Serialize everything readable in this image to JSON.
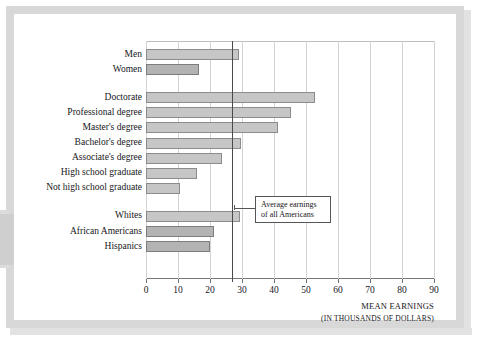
{
  "chart_data": {
    "type": "bar",
    "orientation": "horizontal",
    "title": "",
    "xlabel": "MEAN EARNINGS",
    "xlabel_sub": "(IN THOUSANDS OF DOLLARS)",
    "ylabel": "",
    "xlim": [
      0,
      90
    ],
    "xticks": [
      0,
      10,
      20,
      30,
      40,
      50,
      60,
      70,
      80,
      90
    ],
    "xtick_labels": [
      "0",
      "10",
      "20",
      "30",
      "40",
      "50",
      "60",
      "70",
      "80",
      "90"
    ],
    "grid": true,
    "grid_axis": "x",
    "legend": "none",
    "units": "thousands of dollars",
    "reference_line": {
      "value": 27,
      "label_line1": "Average earnings",
      "label_line2": "of all Americans",
      "color": "#4a4a4a"
    },
    "groups": [
      {
        "name": "sex",
        "categories": [
          "Men",
          "Women"
        ],
        "values": [
          29.2,
          16.6
        ]
      },
      {
        "name": "education",
        "categories": [
          "Doctorate",
          "Professional degree",
          "Master's degree",
          "Bachelor's degree",
          "Associate's degree",
          "High school graduate",
          "Not high school graduate"
        ],
        "values": [
          52.7,
          45.2,
          41.4,
          29.8,
          23.8,
          16.0,
          10.6
        ]
      },
      {
        "name": "race",
        "categories": [
          "Whites",
          "African Americans",
          "Hispanics"
        ],
        "values": [
          29.4,
          21.1,
          19.9
        ]
      }
    ],
    "categories": [
      "Men",
      "Women",
      "Doctorate",
      "Professional degree",
      "Master's degree",
      "Bachelor's degree",
      "Associate's degree",
      "High school graduate",
      "Not high school graduate",
      "Whites",
      "African Americans",
      "Hispanics"
    ],
    "values": [
      29.2,
      16.6,
      52.7,
      45.2,
      41.4,
      29.8,
      23.8,
      16.0,
      10.6,
      29.4,
      21.1,
      19.9
    ],
    "colors": {
      "bar_fill": "#c6c6c6",
      "bar_fill_alt": "#b3b3b3",
      "bar_border": "#8c8c8c",
      "gridline": "#d3d3d3",
      "axis": "#777777",
      "text": "#16161a",
      "frame": "#d8d8d8"
    }
  }
}
